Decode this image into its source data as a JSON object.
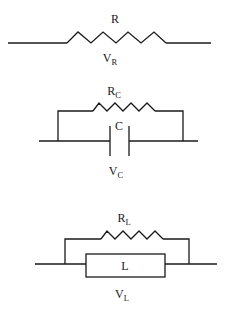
{
  "diagram": {
    "type": "circuit-element-models",
    "stroke_color": "#1a1a1a",
    "background": "#ffffff",
    "elements": [
      {
        "id": "resistor",
        "component_label": {
          "main": "R",
          "sub": ""
        },
        "voltage_label": {
          "main": "V",
          "sub": "R"
        },
        "description": "ideal resistor"
      },
      {
        "id": "capacitor",
        "component_label": {
          "main": "C",
          "sub": ""
        },
        "parallel_resistor_label": {
          "main": "R",
          "sub": "C"
        },
        "voltage_label": {
          "main": "V",
          "sub": "C"
        },
        "description": "capacitor with parallel leakage resistance"
      },
      {
        "id": "inductor",
        "component_label": {
          "main": "L",
          "sub": ""
        },
        "parallel_resistor_label": {
          "main": "R",
          "sub": "L"
        },
        "voltage_label": {
          "main": "V",
          "sub": "L"
        },
        "description": "inductor (box symbol) with parallel resistance"
      }
    ]
  }
}
